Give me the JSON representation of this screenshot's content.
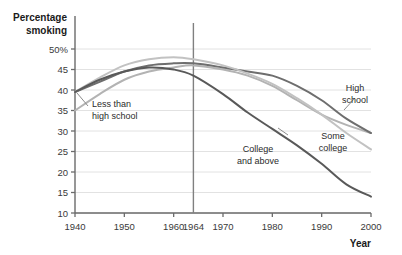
{
  "chart_data": {
    "type": "line",
    "title": "",
    "subtitle": "",
    "ylabel_line1": "Percentage",
    "ylabel_line2": "smoking",
    "xlabel": "Year",
    "xlim": [
      1940,
      2000
    ],
    "ylim": [
      10,
      50
    ],
    "grid": true,
    "legend_position": "inline-annotations",
    "yticks": [
      10,
      15,
      20,
      25,
      30,
      35,
      40,
      45,
      50
    ],
    "yticklabels": [
      "10",
      "15",
      "20",
      "25",
      "30",
      "35",
      "40",
      "45",
      "50%"
    ],
    "xticks": [
      1940,
      1950,
      1960,
      1964,
      1970,
      1980,
      1990,
      2000
    ],
    "xticklabels": [
      "1940",
      "1950",
      "1960",
      "1964",
      "1970",
      "1980",
      "1990",
      "2000"
    ],
    "reference_line": {
      "x": 1964,
      "label": "1964",
      "color": "#808080"
    },
    "annotations": [
      {
        "name": "less-than-high-school",
        "text_line1": "Less than",
        "text_line2": "high school",
        "x": 1946,
        "y": 35.5
      },
      {
        "name": "college-and-above",
        "text_line1": "College",
        "text_line2": "and above",
        "x": 1977,
        "y": 24.5
      },
      {
        "name": "high-school",
        "text_line1": "High",
        "text_line2": "school",
        "x": 1991,
        "y": 36.5
      },
      {
        "name": "some-college",
        "text_line1": "Some",
        "text_line2": "college",
        "x": 1990,
        "y": 27.5
      }
    ],
    "x": [
      1940,
      1945,
      1950,
      1955,
      1960,
      1964,
      1970,
      1975,
      1980,
      1985,
      1990,
      1995,
      2000
    ],
    "series": [
      {
        "name": "Less than high school",
        "color": "#b3b3b3",
        "values": [
          35.0,
          39.0,
          42.5,
          44.5,
          45.5,
          46.0,
          45.0,
          43.5,
          41.0,
          37.5,
          34.0,
          31.5,
          29.5
        ]
      },
      {
        "name": "High school",
        "color": "#6e6e6e",
        "values": [
          39.5,
          42.0,
          44.5,
          46.0,
          46.5,
          46.5,
          45.5,
          44.5,
          43.5,
          41.0,
          37.5,
          33.0,
          29.5
        ]
      },
      {
        "name": "Some college",
        "color": "#c2c2c2",
        "values": [
          39.5,
          43.0,
          46.0,
          47.5,
          48.0,
          47.5,
          46.0,
          44.0,
          41.5,
          38.0,
          34.0,
          29.5,
          25.5
        ]
      },
      {
        "name": "College and above",
        "color": "#595959",
        "values": [
          39.5,
          42.5,
          44.5,
          45.5,
          45.0,
          43.5,
          39.0,
          34.5,
          30.5,
          26.5,
          22.0,
          17.0,
          14.0
        ]
      }
    ]
  }
}
